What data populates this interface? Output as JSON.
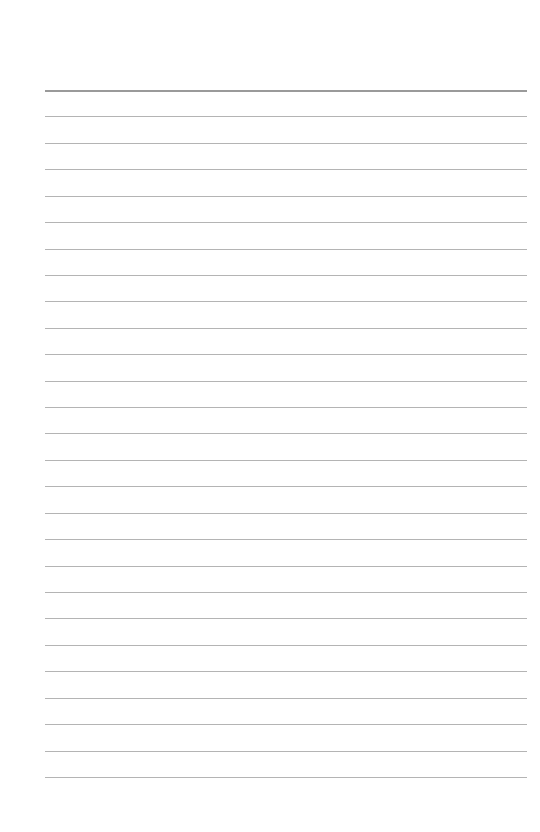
{
  "page": {
    "type": "lined-paper",
    "background_color": "#ffffff",
    "rule_color": "#b4b4b4",
    "top_rule_color": "#9a9a9a",
    "line_count": 27,
    "first_line_y": 90,
    "line_spacing": 26.42,
    "line_left_x": 45,
    "line_right_x": 527,
    "lines_text": []
  }
}
